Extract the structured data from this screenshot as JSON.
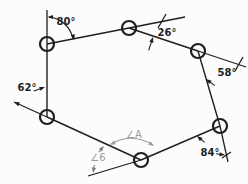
{
  "diagram": {
    "type": "geometry-figure",
    "canvas": {
      "width": 248,
      "height": 184,
      "background": "#fcfcfc"
    },
    "colors": {
      "ink": "#1f1f1f",
      "pencil": "#9c9c9c",
      "pencil_dark": "#7e7e7e"
    },
    "vertices": [
      {
        "id": "vertex-top-left",
        "x": 47,
        "y": 44,
        "r": 7
      },
      {
        "id": "vertex-top-middle",
        "x": 129,
        "y": 28,
        "r": 7
      },
      {
        "id": "vertex-top-right",
        "x": 198,
        "y": 51,
        "r": 7
      },
      {
        "id": "vertex-bottom-right",
        "x": 220,
        "y": 126,
        "r": 7
      },
      {
        "id": "vertex-bottom",
        "x": 141,
        "y": 160,
        "r": 7
      },
      {
        "id": "vertex-bottom-left",
        "x": 47,
        "y": 117,
        "r": 7
      }
    ],
    "edges": [
      [
        0,
        1
      ],
      [
        1,
        2
      ],
      [
        2,
        3
      ],
      [
        3,
        4
      ],
      [
        4,
        5
      ],
      [
        5,
        0
      ]
    ],
    "extension_lines": [
      {
        "id": "ext-above-top-left",
        "x1": 47,
        "y1": 10,
        "x2": 47,
        "y2": 44
      },
      {
        "id": "ext-past-top-middle",
        "x1": 129,
        "y1": 28,
        "x2": 185,
        "y2": 17
      },
      {
        "id": "ext-past-top-right",
        "x1": 198,
        "y1": 51,
        "x2": 246,
        "y2": 67
      },
      {
        "id": "ext-below-bottom-right",
        "x1": 220,
        "y1": 126,
        "x2": 228,
        "y2": 162
      },
      {
        "id": "ext-past-bottom",
        "x1": 141,
        "y1": 160,
        "x2": 88,
        "y2": 176
      },
      {
        "id": "ext-past-bottom-left",
        "x1": 47,
        "y1": 117,
        "x2": 14,
        "y2": 102
      }
    ],
    "ticks": [
      {
        "x1": 166,
        "y1": 14,
        "x2": 158,
        "y2": 28
      },
      {
        "x1": 243,
        "y1": 57,
        "x2": 235,
        "y2": 71
      },
      {
        "x1": 222,
        "y1": 158,
        "x2": 231,
        "y2": 152
      }
    ],
    "arcs": [
      {
        "id": "arc-angle-80",
        "d": "M 49 17 A 27 27 0 0 1 73 39",
        "color": "ink",
        "w": 1.2
      },
      {
        "id": "arc-angle-A",
        "d": "M 111 144 Q 132 132 153 145",
        "color": "pencil",
        "w": 1.1
      }
    ],
    "arrows": [
      {
        "id": "arrowhead-80-left",
        "x": 47.5,
        "y": 17,
        "angle": 180,
        "tail": 0,
        "color": "ink"
      },
      {
        "id": "arrowhead-80-right",
        "x": 74,
        "y": 40,
        "angle": 79,
        "tail": 0,
        "color": "ink"
      },
      {
        "id": "arrowhead-26-lower",
        "x": 153,
        "y": 37,
        "angle": -72,
        "tail": 14,
        "color": "ink"
      },
      {
        "id": "arrowhead-58-lower",
        "x": 206,
        "y": 79,
        "angle": -143,
        "tail": 11,
        "color": "ink"
      },
      {
        "id": "arrowhead-84-left",
        "x": 197,
        "y": 136,
        "angle": -140,
        "tail": 10,
        "color": "ink"
      },
      {
        "id": "arrowhead-84-right",
        "x": 225,
        "y": 155,
        "angle": 8,
        "tail": 9,
        "color": "ink"
      },
      {
        "id": "arrowhead-62-right",
        "x": 45,
        "y": 87,
        "angle": -20,
        "tail": 12,
        "color": "ink"
      },
      {
        "id": "arrowhead-62-extension",
        "x": 14,
        "y": 102,
        "angle": -156,
        "tail": 0,
        "color": "ink"
      },
      {
        "id": "arrowhead-angle-A-left",
        "x": 110,
        "y": 145,
        "angle": 152,
        "tail": 0,
        "color": "pencil"
      },
      {
        "id": "arrowhead-angle-A-right",
        "x": 154,
        "y": 146,
        "angle": 32,
        "tail": 0,
        "color": "pencil"
      },
      {
        "id": "arrowhead-angle-6-up",
        "x": 104,
        "y": 146,
        "angle": -50,
        "tail": 8,
        "color": "pencil_dark"
      },
      {
        "id": "arrowhead-angle-6-down",
        "x": 93,
        "y": 173,
        "angle": 100,
        "tail": 8,
        "color": "pencil_dark"
      }
    ],
    "labels": [
      {
        "id": "angle-80",
        "text": "80°",
        "x": 66,
        "y": 25,
        "color": "ink"
      },
      {
        "id": "angle-26",
        "text": "26°",
        "x": 167,
        "y": 36,
        "color": "ink"
      },
      {
        "id": "angle-58",
        "text": "58°",
        "x": 227,
        "y": 76,
        "color": "ink"
      },
      {
        "id": "angle-84",
        "text": "84°",
        "x": 210,
        "y": 156,
        "color": "ink"
      },
      {
        "id": "angle-62",
        "text": "62°",
        "x": 27,
        "y": 91,
        "color": "ink"
      },
      {
        "id": "angle-A",
        "text": "∠A",
        "x": 134,
        "y": 138,
        "color": "pencil"
      },
      {
        "id": "angle-6",
        "text": "∠6",
        "x": 98,
        "y": 161,
        "color": "pencil"
      }
    ]
  }
}
